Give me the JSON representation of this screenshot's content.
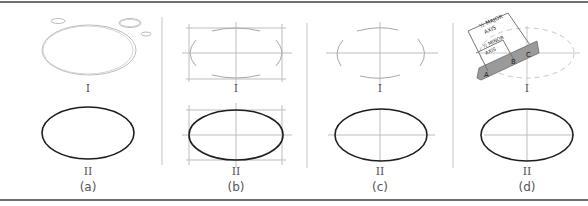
{
  "figure": {
    "panels": [
      {
        "id": "a",
        "caption": "(a)",
        "top_label": "I",
        "bottom_label": "II",
        "description": "Freehand sketch of ellipse with practice circles"
      },
      {
        "id": "b",
        "caption": "(b)",
        "top_label": "I",
        "bottom_label": "II",
        "description": "Ellipse sketched in enclosing rectangle with center lines"
      },
      {
        "id": "c",
        "caption": "(c)",
        "top_label": "I",
        "bottom_label": "II",
        "description": "Ellipse sketched from axes with arcs"
      },
      {
        "id": "d",
        "caption": "(d)",
        "top_label": "I",
        "bottom_label": "II",
        "description": "Trammel method using strip of paper"
      }
    ],
    "trammel": {
      "major_label_line1": "½ MAJOR",
      "major_label_line2": "AXIS",
      "minor_label_line1": "½ MINOR",
      "minor_label_line2": "AXIS",
      "points": [
        "A",
        "B",
        "C"
      ]
    },
    "colors": {
      "rule": "#6e6e6e",
      "construction": "#b8b8b8",
      "ellipse_final": "#1e1e1e",
      "trammel_strip": "#9a9a9a"
    }
  }
}
